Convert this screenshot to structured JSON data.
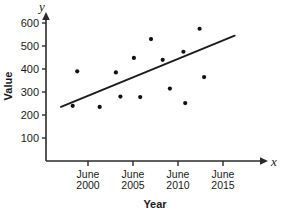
{
  "chart_data": {
    "type": "scatter",
    "title": "",
    "xlabel": "Year",
    "ylabel": "Value",
    "x_axis_symbol": "x",
    "y_axis_symbol": "y",
    "grid": false,
    "legend": "none",
    "xlim": [
      1997.0,
      2016.5
    ],
    "ylim": [
      0,
      640
    ],
    "x_tick_labels": [
      "June 2000",
      "June 2005",
      "June 2010",
      "June 2015"
    ],
    "x_tick_label_lines": [
      [
        "June",
        "2000"
      ],
      [
        "June",
        "2005"
      ],
      [
        "June",
        "2010"
      ],
      [
        "June",
        "2015"
      ]
    ],
    "x_tick_values": [
      2000,
      2005,
      2010,
      2015
    ],
    "y_tick_labels": [
      "100",
      "200",
      "300",
      "400",
      "500",
      "600"
    ],
    "y_tick_values": [
      100,
      200,
      300,
      400,
      500,
      600
    ],
    "points": [
      {
        "x": 1998.3,
        "y": 240
      },
      {
        "x": 1998.8,
        "y": 390
      },
      {
        "x": 2001.3,
        "y": 235
      },
      {
        "x": 2003.1,
        "y": 385
      },
      {
        "x": 2003.6,
        "y": 280
      },
      {
        "x": 2005.1,
        "y": 448
      },
      {
        "x": 2005.8,
        "y": 278
      },
      {
        "x": 2007.0,
        "y": 530
      },
      {
        "x": 2008.3,
        "y": 440
      },
      {
        "x": 2009.1,
        "y": 315
      },
      {
        "x": 2010.6,
        "y": 475
      },
      {
        "x": 2010.8,
        "y": 252
      },
      {
        "x": 2012.4,
        "y": 575
      },
      {
        "x": 2012.9,
        "y": 365
      }
    ],
    "trend_line": {
      "x_start": 1997.0,
      "y_start": 235,
      "x_end": 2016.3,
      "y_end": 545
    },
    "colors": {
      "axis": "#2b2b2b",
      "point": "#111111",
      "trend": "#1c1c1c",
      "background": "#ffffff",
      "text": "#1a1a1a"
    }
  }
}
